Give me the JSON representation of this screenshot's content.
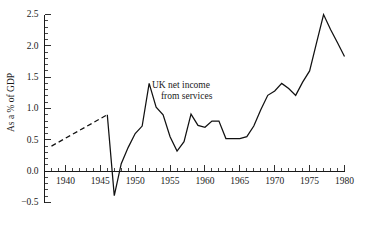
{
  "chart_data": {
    "type": "line",
    "title": "",
    "subtitle": "",
    "xlabel": "",
    "ylabel": "As a % of GDP",
    "xlim": [
      1937,
      1980
    ],
    "ylim": [
      -0.5,
      2.5
    ],
    "grid": false,
    "legend": null,
    "x_ticks_major": [
      1940,
      1945,
      1950,
      1955,
      1960,
      1965,
      1970,
      1975,
      1980
    ],
    "x_tick_labels": [
      "1940",
      "1945",
      "1950",
      "1955",
      "1960",
      "1965",
      "1970",
      "1975",
      "1980"
    ],
    "x_tick_minor_step": 1,
    "y_ticks_major": [
      -0.5,
      0.0,
      0.5,
      1.0,
      1.5,
      2.0,
      2.5
    ],
    "y_tick_labels": [
      "−0.5",
      "0.0",
      "0.5",
      "1.0",
      "1.5",
      "2.0",
      "2.5"
    ],
    "y_tick_minor_step": 0.1,
    "series": [
      {
        "name": "UK net income from services",
        "style": "dashed",
        "color": "#111111",
        "x": [
          1938,
          1946
        ],
        "values": [
          0.4,
          0.9
        ]
      },
      {
        "name": "UK net income from services",
        "style": "solid",
        "color": "#111111",
        "x": [
          1946,
          1947,
          1948,
          1949,
          1950,
          1951,
          1952,
          1953,
          1954,
          1955,
          1956,
          1957,
          1958,
          1959,
          1960,
          1961,
          1962,
          1963,
          1964,
          1965,
          1966,
          1967,
          1968,
          1969,
          1970,
          1971,
          1972,
          1973,
          1974,
          1975,
          1976,
          1977,
          1978,
          1979,
          1980
        ],
        "values": [
          0.9,
          -0.39,
          0.12,
          0.38,
          0.6,
          0.72,
          1.4,
          1.02,
          0.9,
          0.55,
          0.32,
          0.47,
          0.91,
          0.73,
          0.7,
          0.8,
          0.8,
          0.52,
          0.52,
          0.52,
          0.55,
          0.72,
          0.98,
          1.21,
          1.28,
          1.4,
          1.32,
          1.21,
          1.42,
          1.6,
          2.05,
          2.5,
          2.26,
          2.05,
          1.83
        ]
      }
    ],
    "annotations": [
      {
        "name": "series-label",
        "lines": [
          "UK net income",
          "from services"
        ],
        "x": 1952.4,
        "y": 1.33
      }
    ]
  },
  "axis": {
    "y_axis_title": "As a % of GDP"
  }
}
